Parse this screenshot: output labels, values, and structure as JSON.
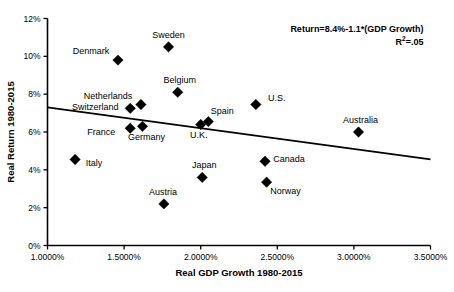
{
  "chart_data": {
    "type": "scatter",
    "title": "",
    "xlabel": "Real GDP Growth 1980-2015",
    "ylabel": "Real Return 1980-2015",
    "xlim": [
      1.0,
      3.5
    ],
    "ylim": [
      0,
      12
    ],
    "grid": false,
    "legend": false,
    "x_ticks": [
      "1.0000%",
      "1.5000%",
      "2.0000%",
      "2.5000%",
      "3.0000%",
      "3.5000%"
    ],
    "x_tick_values": [
      1.0,
      1.5,
      2.0,
      2.5,
      3.0,
      3.5
    ],
    "y_ticks": [
      "0%",
      "2%",
      "4%",
      "6%",
      "8%",
      "10%",
      "12%"
    ],
    "y_tick_values": [
      0,
      2,
      4,
      6,
      8,
      10,
      12
    ],
    "points": [
      {
        "name": "Sweden",
        "x": 1.79,
        "y": 10.5,
        "label_dx": 0,
        "label_dy": -9
      },
      {
        "name": "Denmark",
        "x": 1.46,
        "y": 9.8,
        "label_dx": -27,
        "label_dy": -6
      },
      {
        "name": "Belgium",
        "x": 1.85,
        "y": 8.1,
        "label_dx": 2,
        "label_dy": -9
      },
      {
        "name": "Netherlands",
        "x": 1.61,
        "y": 7.45,
        "label_dx": -33,
        "label_dy": -6
      },
      {
        "name": "U.S.",
        "x": 2.36,
        "y": 7.45,
        "label_dx": 21,
        "label_dy": -4
      },
      {
        "name": "Switzerland",
        "x": 1.54,
        "y": 7.25,
        "label_dx": -35,
        "label_dy": 2
      },
      {
        "name": "Spain",
        "x": 2.05,
        "y": 6.55,
        "label_dx": 14,
        "label_dy": -8
      },
      {
        "name": "U.K.",
        "x": 2.0,
        "y": 6.4,
        "label_dx": -2,
        "label_dy": 14
      },
      {
        "name": "Germany",
        "x": 1.62,
        "y": 6.3,
        "label_dx": 4,
        "label_dy": 14
      },
      {
        "name": "France",
        "x": 1.54,
        "y": 6.2,
        "label_dx": -29,
        "label_dy": 7
      },
      {
        "name": "Australia",
        "x": 3.03,
        "y": 6.0,
        "label_dx": 2,
        "label_dy": -9
      },
      {
        "name": "Italy",
        "x": 1.18,
        "y": 4.55,
        "label_dx": 19,
        "label_dy": 7
      },
      {
        "name": "Canada",
        "x": 2.42,
        "y": 4.45,
        "label_dx": 24,
        "label_dy": 1
      },
      {
        "name": "Japan",
        "x": 2.01,
        "y": 3.6,
        "label_dx": 2,
        "label_dy": -9
      },
      {
        "name": "Norway",
        "x": 2.43,
        "y": 3.35,
        "label_dx": 19,
        "label_dy": 12
      },
      {
        "name": "Austria",
        "x": 1.76,
        "y": 2.2,
        "label_dx": -1,
        "label_dy": -9
      }
    ],
    "trendline": {
      "x0": 1.0,
      "y0": 7.3,
      "x1": 3.5,
      "y1": 4.55
    },
    "annotation": {
      "equation": "Return=8.4%-1.1*(GDP Growth)",
      "r_squared_prefix": "R",
      "r_squared_sup": "2",
      "r_squared_value": "=.05"
    },
    "colors": {
      "marker": "#000000",
      "line": "#000000",
      "axis": "#000000",
      "background": "#ffffff"
    }
  }
}
